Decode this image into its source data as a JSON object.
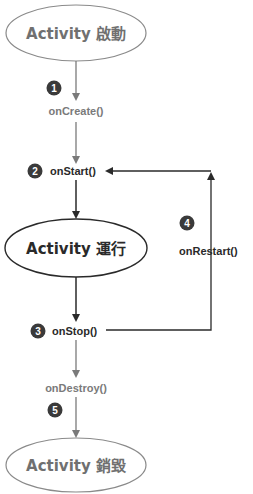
{
  "colors": {
    "gray": "#7a7a7a",
    "dark": "#2a2a2a",
    "badge": "#3a3a3a",
    "background": "#ffffff"
  },
  "states": {
    "start": "Activity 啟動",
    "running": "Activity 運行",
    "destroyed": "Activity 銷毀"
  },
  "steps": [
    {
      "number": "1",
      "method": "onCreate()"
    },
    {
      "number": "2",
      "method": "onStart()"
    },
    {
      "number": "3",
      "method": "onStop()"
    },
    {
      "number": "4",
      "method": "onRestart()"
    },
    {
      "number": "5",
      "method": "onDestroy()"
    }
  ]
}
